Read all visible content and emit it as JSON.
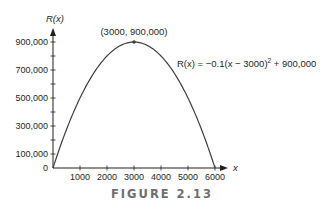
{
  "chart_data": {
    "type": "line",
    "title": "",
    "caption": "FIGURE 2.13",
    "xlabel": "x",
    "ylabel": "R(x)",
    "xlim": [
      0,
      6000
    ],
    "ylim": [
      0,
      900000
    ],
    "x_ticks": [
      1000,
      2000,
      3000,
      4000,
      5000,
      6000
    ],
    "x_tick_labels": [
      "1000",
      "2000",
      "3000",
      "4000",
      "5000",
      "6000"
    ],
    "y_ticks": [
      0,
      100000,
      300000,
      500000,
      700000,
      900000
    ],
    "y_tick_labels": [
      "0",
      "100,000",
      "300,000",
      "500,000",
      "700,000",
      "900,000"
    ],
    "grid": false,
    "series": [
      {
        "name": "R(x) = −0.1(x − 3000)² + 900,000",
        "function": "-0.1*(x-3000)^2 + 900000",
        "x": [
          0,
          500,
          1000,
          1500,
          2000,
          2500,
          3000,
          3500,
          4000,
          4500,
          5000,
          5500,
          6000
        ],
        "values": [
          0,
          275000,
          500000,
          675000,
          800000,
          875000,
          900000,
          875000,
          800000,
          675000,
          500000,
          275000,
          0
        ]
      }
    ],
    "annotations": [
      {
        "text": "(3000, 900,000)",
        "x": 3000,
        "y": 900000,
        "type": "vertex-point"
      },
      {
        "text_main": "R(x) = −0.1(x − 3000)",
        "superscript": "2",
        "text_tail": " + 900,000",
        "type": "equation-label"
      }
    ]
  },
  "colors": {
    "curve": "#3d3d3d",
    "axis": "#231f20",
    "caption": "#6d6e71"
  }
}
